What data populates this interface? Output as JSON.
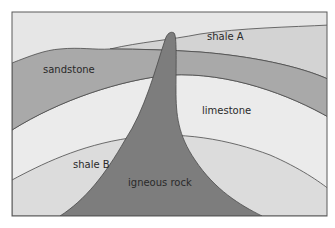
{
  "diagram": {
    "type": "geological cross-section",
    "layers": [
      {
        "id": "shale-a",
        "label": "shale A",
        "color": "#d3d3d3"
      },
      {
        "id": "sandstone",
        "label": "sandstone",
        "color": "#a9a9a9"
      },
      {
        "id": "limestone",
        "label": "limestone",
        "color": "#ebebeb"
      },
      {
        "id": "shale-b",
        "label": "shale B",
        "color": "#dcdcdc"
      },
      {
        "id": "igneous-rock",
        "label": "igneous rock",
        "color": "#7d7d7d"
      }
    ],
    "background_color": "#e6e6e6",
    "outline_color": "#4a4a4a"
  }
}
